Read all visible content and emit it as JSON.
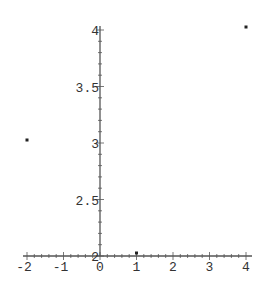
{
  "chart_data": {
    "type": "scatter",
    "title": "",
    "xlabel": "",
    "ylabel": "",
    "points": [
      {
        "x": -2,
        "y": 3
      },
      {
        "x": 1,
        "y": 2
      },
      {
        "x": 4,
        "y": 4
      }
    ],
    "xlim": [
      -2,
      4
    ],
    "ylim": [
      2,
      4
    ],
    "axes_origin": {
      "x": 0,
      "y": 2
    },
    "x_ticks": [
      -2,
      -1,
      0,
      1,
      2,
      3,
      4
    ],
    "x_tick_labels": [
      "-2",
      "-1",
      "0",
      "1",
      "2",
      "3",
      "4"
    ],
    "y_ticks": [
      2,
      2.5,
      3,
      3.5,
      4
    ],
    "y_tick_labels": [
      "2",
      "2.5",
      "3",
      "3.5",
      "4"
    ],
    "grid": false,
    "legend": null
  },
  "style": {
    "axis_color": "#555555",
    "point_color": "#222222",
    "label_color": "#333333"
  }
}
